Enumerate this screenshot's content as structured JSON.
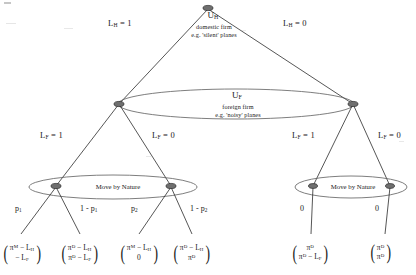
{
  "diagram": {
    "type": "extensive-form-game-tree",
    "title_node_top": {
      "label": "U_H",
      "label_html": "U<sub>H</sub>",
      "subtitle_line1": "domestic firm",
      "subtitle_line2": "e.g. 'silent' planes"
    },
    "info_set_middle": {
      "label": "U_F",
      "label_html": "U<sub>F</sub>",
      "subtitle_line1": "foreign firm",
      "subtitle_line2": "e.g. 'noisy' planes"
    },
    "nature_left_label": "Move by Nature",
    "nature_right_label": "Move by Nature",
    "branch_labels": {
      "top_left": "L_H = 1",
      "top_left_html": "L<sub>H</sub> = 1",
      "top_right": "L_H = 0",
      "top_right_html": "L<sub>H</sub> = 0",
      "mid_left_1": "L_F = 1",
      "mid_left_1_html": "L<sub>F</sub> = 1",
      "mid_left_2": "L_F = 0",
      "mid_left_2_html": "L<sub>F</sub> = 0",
      "mid_right_1": "L_F = 1",
      "mid_right_1_html": "L<sub>F</sub> = 1",
      "mid_right_2": "L_F = 0",
      "mid_right_2_html": "L<sub>F</sub> = 0"
    },
    "probabilities": [
      {
        "id": "p1",
        "text": "p_1",
        "html": "p<sub>1</sub>"
      },
      {
        "id": "one-minus-p1",
        "text": "1 - p_1",
        "html": "1 - p<sub>1</sub>"
      },
      {
        "id": "p2",
        "text": "p_2",
        "html": "p<sub>2</sub>"
      },
      {
        "id": "one-minus-p2",
        "text": "1 - p_2",
        "html": "1 - p<sub>2</sub>"
      },
      {
        "id": "zero-left",
        "text": "0",
        "html": "0"
      },
      {
        "id": "zero-right",
        "text": "0",
        "html": "0"
      }
    ],
    "payoffs": [
      {
        "id": "payoff-1",
        "top": "π^M - L_H",
        "top_html": "π<sup>M</sup> − L<sub>H</sub>",
        "bottom": "- L_F",
        "bottom_html": "− L<sub>F</sub>"
      },
      {
        "id": "payoff-2",
        "top": "π^D - L_H",
        "top_html": "π<sup>D</sup> − L<sub>H</sub>",
        "bottom": "π^D - L_F",
        "bottom_html": "π<sup>D</sup> − L<sub>F</sub>"
      },
      {
        "id": "payoff-3",
        "top": "π^M - L_H",
        "top_html": "π<sup>M</sup> − L<sub>H</sub>",
        "bottom": "0",
        "bottom_html": "0"
      },
      {
        "id": "payoff-4",
        "top": "π^D - L_H",
        "top_html": "π<sup>D</sup> − L<sub>H</sub>",
        "bottom": "π^D",
        "bottom_html": "π<sup>D</sup>"
      },
      {
        "id": "payoff-5",
        "top": "π^D",
        "top_html": "π<sup>D</sup>",
        "bottom": "π^D - L_F",
        "bottom_html": "π<sup>D</sup> − L<sub>F</sub>"
      },
      {
        "id": "payoff-6",
        "top": "π^D",
        "top_html": "π<sup>D</sup>",
        "bottom": "π^D",
        "bottom_html": "π<sup>D</sup>"
      }
    ],
    "colors": {
      "line": "#2b2b2b",
      "node_fill": "#6f6f6f",
      "text": "#1a1a1a",
      "background": "#ffffff"
    }
  }
}
